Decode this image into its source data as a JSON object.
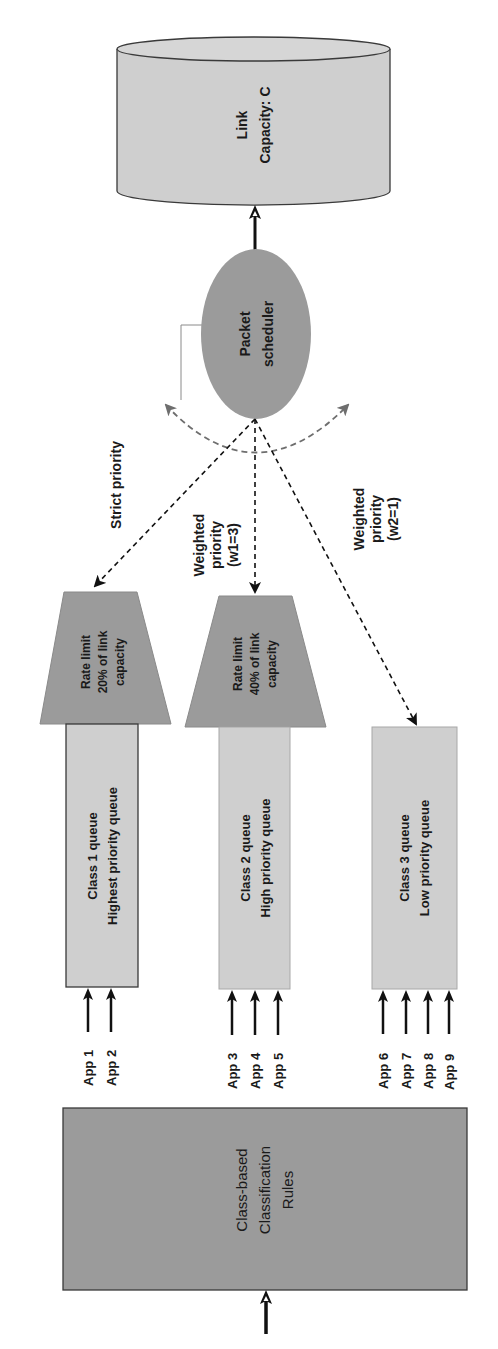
{
  "diagram": {
    "orientation": "rotated-90-ccw",
    "colors": {
      "light_fill": "#cfcfcf",
      "dark_fill": "#9b9b9b",
      "stroke": "#3a3a3a",
      "arrow": "#111111",
      "dashed_gray": "#6e6e6e"
    },
    "link": {
      "line1": "Link",
      "line2": "Capacity: C"
    },
    "scheduler": {
      "line1": "Packet",
      "line2": "scheduler"
    },
    "policies": {
      "strict": "Strict priority",
      "weighted1": {
        "line1": "Weighted",
        "line2": "priority",
        "line3": "(w1=3)"
      },
      "weighted2": {
        "line1": "Weighted",
        "line2": "priority",
        "line3": "(w2=1)"
      }
    },
    "rate_limits": [
      {
        "line1": "Rate limit",
        "line2": "20% of link",
        "line3": "capacity"
      },
      {
        "line1": "Rate limit",
        "line2": "40% of link",
        "line3": "capacity"
      }
    ],
    "queues": [
      {
        "line1": "Class 1 queue",
        "line2": "Highest priority queue"
      },
      {
        "line1": "Class 2 queue",
        "line2": "High priority queue"
      },
      {
        "line1": "Class 3 queue",
        "line2": "Low priority queue"
      }
    ],
    "apps": {
      "class1": [
        "App 1",
        "App 2"
      ],
      "class2": [
        "App 3",
        "App 4",
        "App 5"
      ],
      "class3": [
        "App 6",
        "App 7",
        "App 8",
        "App 9"
      ]
    },
    "classifier": {
      "line1": "Class-based",
      "line2": "Classification",
      "line3": "Rules"
    }
  }
}
